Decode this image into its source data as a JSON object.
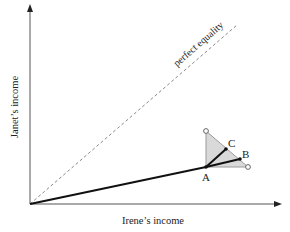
{
  "diagram": {
    "type": "income-distribution-diagram",
    "x_axis_label": "Irene’s income",
    "y_axis_label": "Janet’s income",
    "equality_line_label": "perfect equality",
    "points": {
      "A": "A",
      "B": "B",
      "C": "C"
    },
    "colors": {
      "axis": "#444444",
      "line": "#111111",
      "dashed": "#888888",
      "triangle_fill": "#d9d9d9",
      "triangle_stroke": "#9a9a9a"
    }
  }
}
